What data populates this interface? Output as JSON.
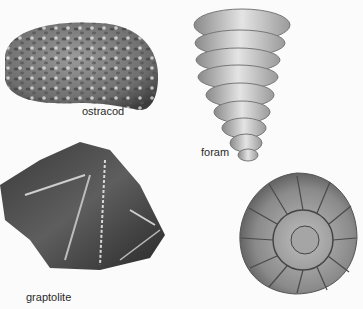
{
  "illustration": {
    "specimens": [
      {
        "name": "ostracod",
        "label": "ostracod"
      },
      {
        "name": "foram",
        "label": "foram"
      },
      {
        "name": "graptolite",
        "label": "graptolite"
      },
      {
        "name": "ammonite",
        "label": ""
      }
    ]
  },
  "colors": {
    "background": "#fbfbfb",
    "label_text": "#2a2a2a"
  }
}
